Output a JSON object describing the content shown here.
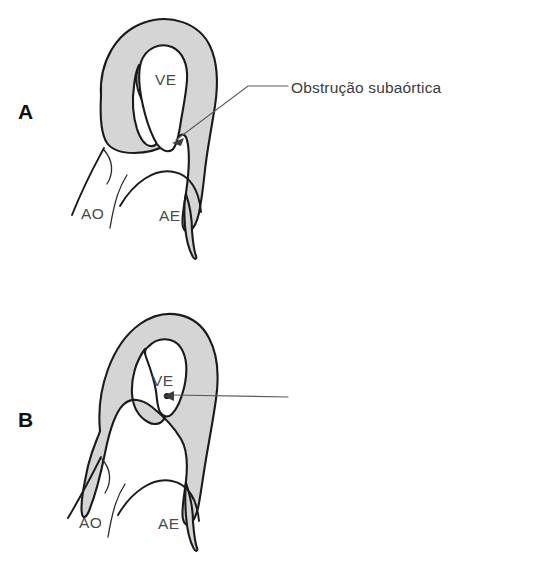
{
  "figure": {
    "background_color": "#ffffff",
    "myocardium_fill": "#d5d5d5",
    "outline_color": "#1a1a1a",
    "label_color": "#4a4a4a",
    "callout_color": "#3c3c3c"
  },
  "panels": [
    {
      "letter": "A",
      "callout": "Obstrução subaórtica",
      "labels": {
        "ventricle": "VE",
        "aorta": "AO",
        "atrium": "AE"
      }
    },
    {
      "letter": "B",
      "callout": "Obstrução medioventricular",
      "labels": {
        "ventricle": "VE",
        "aorta": "AO",
        "atrium": "AE"
      }
    }
  ]
}
